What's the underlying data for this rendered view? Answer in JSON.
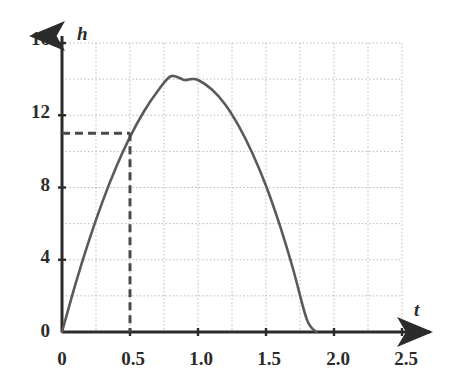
{
  "chart_data": {
    "type": "line",
    "title": "",
    "xlabel": "t",
    "ylabel": "h",
    "xlim": [
      0,
      2.5
    ],
    "ylim": [
      0,
      16
    ],
    "grid": true,
    "grid_x_step": 0.25,
    "grid_y_step": 2,
    "legend": "none",
    "x_ticks": [
      {
        "value": 0,
        "label": "0"
      },
      {
        "value": 0.5,
        "label": "0.5"
      },
      {
        "value": 1.0,
        "label": "1.0"
      },
      {
        "value": 1.5,
        "label": "1.5"
      },
      {
        "value": 2.0,
        "label": "2.0"
      },
      {
        "value": 2.5,
        "label": "2.5"
      }
    ],
    "y_ticks": [
      {
        "value": 0,
        "label": "0"
      },
      {
        "value": 4,
        "label": "4"
      },
      {
        "value": 8,
        "label": "8"
      },
      {
        "value": 12,
        "label": "12"
      },
      {
        "value": 16,
        "label": "16"
      }
    ],
    "series": [
      {
        "name": "h(t)",
        "type": "parabola",
        "color": "#5a5a5a",
        "x": [
          0.0,
          0.1,
          0.2,
          0.3,
          0.4,
          0.5,
          0.6,
          0.7,
          0.8,
          0.9,
          0.95,
          1.0,
          1.1,
          1.2,
          1.3,
          1.4,
          1.5,
          1.6,
          1.7,
          1.8,
          1.87
        ],
        "y": [
          0.0,
          2.68,
          5.1,
          7.26,
          9.16,
          10.8,
          12.18,
          13.3,
          14.16,
          13.95,
          14.0,
          13.95,
          13.44,
          12.6,
          11.4,
          9.9,
          8.1,
          5.94,
          3.46,
          0.7,
          0.0
        ]
      }
    ],
    "annotations": [
      {
        "name": "reference-point",
        "kind": "dashed-crosshair",
        "x": 0.5,
        "y": 11,
        "color": "#4a4a4a"
      }
    ]
  },
  "axes": {
    "y_axis_name": "h",
    "x_axis_name": "t",
    "y_axis_arrow": "up-arrow-icon",
    "x_axis_arrow": "right-arrow-icon"
  }
}
